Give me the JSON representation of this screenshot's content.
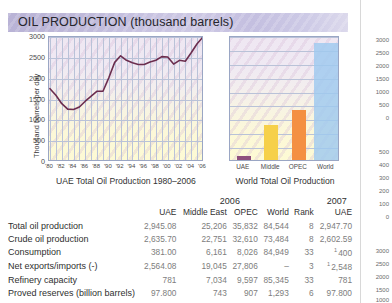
{
  "banner": {
    "title": "OIL PRODUCTION (thousand barrels)"
  },
  "line_chart": {
    "caption": "UAE Total Oil Production 1980–2006",
    "ylabel": "Thousand barrels per day"
  },
  "bar_chart": {
    "caption": "World Total Oil Production"
  },
  "table": {
    "group_headers": [
      {
        "label": "2006"
      },
      {
        "label": "2007"
      }
    ],
    "columns": [
      "",
      "UAE",
      "Middle East",
      "OPEC",
      "World",
      "Rank",
      "UAE"
    ],
    "rows": [
      {
        "label": "Total oil production",
        "cells": [
          "2,945.08",
          "25,206",
          "35,832",
          "84,544",
          "8",
          "2,947.70"
        ],
        "sup": [
          "",
          "",
          "",
          "",
          "",
          ""
        ]
      },
      {
        "label": "Crude oil production",
        "cells": [
          "2,635.70",
          "22,751",
          "32,610",
          "73,484",
          "8",
          "2,602.59"
        ],
        "sup": [
          "",
          "",
          "",
          "",
          "",
          ""
        ]
      },
      {
        "label": "Consumption",
        "cells": [
          "381.00",
          "6,161",
          "8,026",
          "84,949",
          "33",
          "400"
        ],
        "sup": [
          "",
          "",
          "",
          "",
          "",
          "1"
        ]
      },
      {
        "label": "Net exports/imports (-)",
        "cells": [
          "2,564.08",
          "19,045",
          "27,806",
          "–",
          "3",
          "2,548"
        ],
        "sup": [
          "",
          "",
          "",
          "",
          "",
          "1"
        ]
      },
      {
        "label": "Refinery capacity",
        "cells": [
          "781",
          "7,034",
          "9,597",
          "85,345",
          "33",
          "781"
        ],
        "sup": [
          "",
          "",
          "",
          "",
          "",
          ""
        ]
      },
      {
        "label": "Proved reserves (billion barrels)",
        "cells": [
          "97.800",
          "743",
          "907",
          "1,293",
          "6",
          "97.800"
        ],
        "sup": [
          "",
          "",
          "",
          "",
          "",
          ""
        ]
      }
    ]
  },
  "next_page_axis_ticks": [
    "3000",
    "2500",
    "2000",
    "1500",
    "1000",
    "500",
    "0",
    "500",
    "400",
    "300",
    "200",
    "100",
    "0",
    "3000",
    "2500",
    "2000",
    "1500",
    "1000"
  ],
  "colors": {
    "banner_start": "#b9b3d6",
    "banner_end": "#dcd9ec",
    "line": "#6b2d4e",
    "bar_uae": "#8e4f7d",
    "bar_middle_east": "#f6d049",
    "bar_opec": "#f49042",
    "bar_world": "#9fc9ef",
    "grid": "#b9c2d8",
    "axis_text": "#4a4a4a"
  },
  "chart_data": [
    {
      "type": "line",
      "title": "UAE Total Oil Production 1980–2006",
      "xlabel": "",
      "ylabel": "Thousand barrels per day",
      "ylim": [
        0,
        3000
      ],
      "yticks": [
        0,
        500,
        1000,
        1500,
        2000,
        2500,
        3000
      ],
      "xticks": [
        "'80",
        "'82",
        "'84",
        "'86",
        "'88",
        "'90",
        "'92",
        "'94",
        "'96",
        "'98",
        "'00",
        "'02",
        "'04",
        "'06"
      ],
      "grid": true,
      "legend": "none",
      "x": [
        1980,
        1981,
        1982,
        1983,
        1984,
        1985,
        1986,
        1987,
        1988,
        1989,
        1990,
        1991,
        1992,
        1993,
        1994,
        1995,
        1996,
        1997,
        1998,
        1999,
        2000,
        2001,
        2002,
        2003,
        2004,
        2005,
        2006
      ],
      "values": [
        1760,
        1600,
        1400,
        1270,
        1260,
        1320,
        1460,
        1580,
        1700,
        1700,
        2020,
        2390,
        2550,
        2440,
        2380,
        2340,
        2340,
        2400,
        2440,
        2530,
        2520,
        2350,
        2440,
        2420,
        2620,
        2840,
        3000
      ]
    },
    {
      "type": "bar",
      "title": "World Total Oil Production",
      "xlabel": "",
      "ylabel": "",
      "ylim": [
        0,
        90000
      ],
      "grid": true,
      "legend": "none",
      "categories": [
        "UAE",
        "Middle",
        "OPEC",
        "World"
      ],
      "values": [
        2945,
        25206,
        35832,
        84544
      ],
      "colors": [
        "#8e4f7d",
        "#f6d049",
        "#f49042",
        "#9fc9ef"
      ]
    }
  ]
}
